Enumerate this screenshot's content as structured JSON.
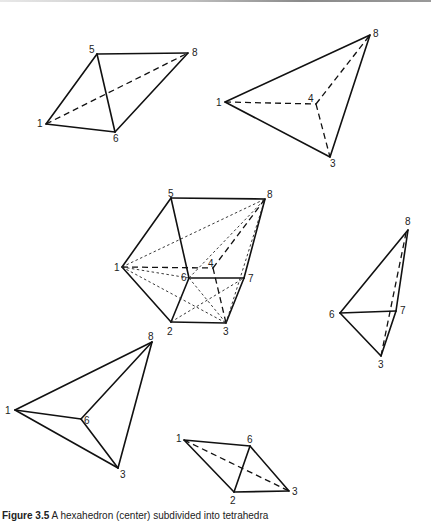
{
  "figure": {
    "caption_label": "Figure 3.5",
    "caption_text": "A hexahedron (center) subdivided into tetrahedra",
    "polyhedra": [
      {
        "name": "tetra-1-5-6-8",
        "vertices": [
          "1",
          "5",
          "6",
          "8"
        ]
      },
      {
        "name": "tetra-1-3-4-8",
        "vertices": [
          "1",
          "3",
          "4",
          "8"
        ]
      },
      {
        "name": "hexahedron",
        "vertices": [
          "1",
          "2",
          "3",
          "4",
          "5",
          "6",
          "7",
          "8"
        ]
      },
      {
        "name": "tetra-3-6-7-8",
        "vertices": [
          "3",
          "6",
          "7",
          "8"
        ]
      },
      {
        "name": "tetra-1-3-6-8",
        "vertices": [
          "1",
          "3",
          "6",
          "8"
        ]
      },
      {
        "name": "tetra-1-2-3-6",
        "vertices": [
          "1",
          "2",
          "3",
          "6"
        ]
      }
    ]
  },
  "labels": {
    "t1": {
      "v1": "1",
      "v5": "5",
      "v6": "6",
      "v8": "8"
    },
    "t2": {
      "v1": "1",
      "v4": "4",
      "v3": "3",
      "v8": "8"
    },
    "hex": {
      "v1": "1",
      "v2": "2",
      "v3": "3",
      "v4": "4",
      "v5": "5",
      "v6": "6",
      "v7": "7",
      "v8": "8"
    },
    "t3": {
      "v6": "6",
      "v7": "7",
      "v3": "3",
      "v8": "8"
    },
    "t4": {
      "v1": "1",
      "v6": "6",
      "v3": "3",
      "v8": "8"
    },
    "t5": {
      "v1": "1",
      "v6": "6",
      "v2": "2",
      "v3": "3"
    }
  }
}
